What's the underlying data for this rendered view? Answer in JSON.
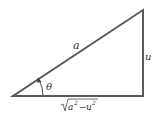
{
  "diagram": {
    "type": "right-triangle",
    "labels": {
      "hypotenuse": "a",
      "opposite": "u",
      "angle": "θ",
      "adjacent_radicand_a": "a",
      "adjacent_radicand_u": "u",
      "adjacent_minus": "−",
      "exponent": "2"
    },
    "colors": {
      "stroke": "#555555",
      "text": "#333333"
    }
  }
}
